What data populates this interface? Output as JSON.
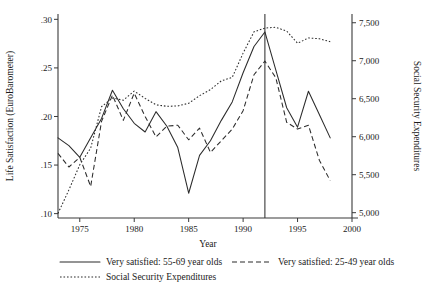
{
  "chart_data": {
    "type": "line",
    "title": "",
    "xlabel": "Year",
    "ylabel": "Life Satisfaction (EuroBarometer)",
    "ylabel_right": "Social Security Expenditures",
    "xlim": [
      1973,
      2000
    ],
    "ylim": [
      0.1,
      0.3
    ],
    "ylim_right": [
      5000,
      7500
    ],
    "xticks": [
      1975,
      1980,
      1985,
      1990,
      1995,
      2000
    ],
    "xticklabels": [
      "1975",
      "1980",
      "1985",
      "1990",
      "1995",
      "2000"
    ],
    "yticks": [
      0.1,
      0.15,
      0.2,
      0.25,
      0.3
    ],
    "yticklabels": [
      ".10",
      ".15",
      ".20",
      ".25",
      ".30"
    ],
    "yticks_right": [
      5000,
      5500,
      6000,
      6500,
      7000,
      7500
    ],
    "yticklabels_right": [
      "5,000",
      "5,500",
      "6,000",
      "6,500",
      "7,000",
      "7,500"
    ],
    "grid": false,
    "legend_position": "below-axes",
    "annotations": [
      {
        "name": "reunification-vertical-line",
        "type": "vline",
        "x": 1992
      }
    ],
    "series": [
      {
        "name": "Very satisfied: 55-69 year olds",
        "style": "solid",
        "axis": "left",
        "x": [
          1973,
          1974,
          1975,
          1976,
          1977,
          1978,
          1979,
          1980,
          1981,
          1982,
          1983,
          1984,
          1985,
          1986,
          1987,
          1988,
          1989,
          1990,
          1991,
          1992,
          1993,
          1994,
          1995,
          1996,
          1997,
          1998
        ],
        "y": [
          0.178,
          0.17,
          0.158,
          0.178,
          0.198,
          0.227,
          0.208,
          0.193,
          0.184,
          0.205,
          0.19,
          0.168,
          0.121,
          0.16,
          0.175,
          0.196,
          0.215,
          0.245,
          0.272,
          0.287,
          0.248,
          0.209,
          0.189,
          0.226,
          0.202,
          0.178
        ]
      },
      {
        "name": "Very satisfied: 25-49 year olds",
        "style": "dashed",
        "axis": "left",
        "x": [
          1973,
          1974,
          1975,
          1976,
          1977,
          1978,
          1979,
          1980,
          1981,
          1982,
          1983,
          1984,
          1985,
          1986,
          1987,
          1988,
          1989,
          1990,
          1991,
          1992,
          1993,
          1994,
          1995,
          1996,
          1997,
          1998
        ],
        "y": [
          0.162,
          0.148,
          0.158,
          0.128,
          0.195,
          0.222,
          0.196,
          0.224,
          0.2,
          0.179,
          0.19,
          0.191,
          0.176,
          0.188,
          0.163,
          0.175,
          0.187,
          0.206,
          0.243,
          0.257,
          0.24,
          0.194,
          0.187,
          0.191,
          0.155,
          0.134
        ]
      },
      {
        "name": "Social Security Expenditures",
        "style": "dotted",
        "axis": "right",
        "x": [
          1973,
          1974,
          1975,
          1976,
          1977,
          1978,
          1979,
          1980,
          1981,
          1982,
          1983,
          1984,
          1985,
          1986,
          1987,
          1988,
          1989,
          1990,
          1991,
          1992,
          1993,
          1994,
          1995,
          1996,
          1997,
          1998
        ],
        "y": [
          4990,
          5300,
          5630,
          5850,
          6395,
          6510,
          6480,
          6600,
          6505,
          6420,
          6400,
          6405,
          6440,
          6540,
          6620,
          6735,
          6780,
          7100,
          7380,
          7430,
          7440,
          7390,
          7230,
          7300,
          7290,
          7250
        ]
      }
    ],
    "legend": [
      {
        "label": "Very satisfied: 55-69 year olds",
        "style": "solid"
      },
      {
        "label": "Very satisfied: 25-49 year olds",
        "style": "dashed"
      },
      {
        "label": "Social Security Expenditures",
        "style": "dotted"
      }
    ]
  }
}
